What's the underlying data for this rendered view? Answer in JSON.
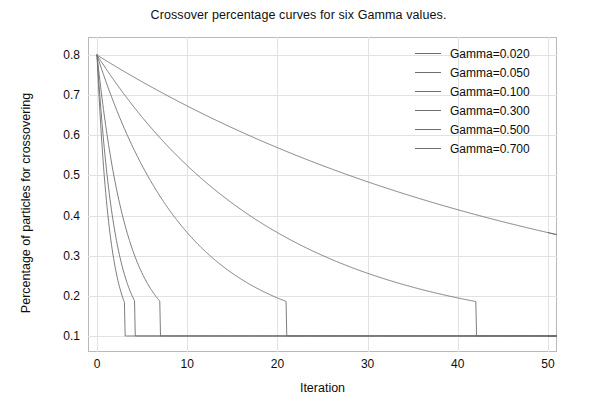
{
  "chart_data": {
    "type": "line",
    "title": "Crossover percentage curves for six Gamma values.",
    "xlabel": "Iteration",
    "ylabel": "Percentage of particles for crossovering",
    "xlim": [
      -1,
      51
    ],
    "ylim": [
      0.06,
      0.845
    ],
    "xticks": [
      0,
      10,
      20,
      30,
      40,
      50
    ],
    "xtick_labels": [
      "0",
      "10",
      "20",
      "30",
      "40",
      "50"
    ],
    "yticks": [
      0.1,
      0.2,
      0.3,
      0.4,
      0.5,
      0.6,
      0.7,
      0.8
    ],
    "ytick_labels": [
      "0.1",
      "0.2",
      "0.3",
      "0.4",
      "0.5",
      "0.6",
      "0.7",
      "0.8"
    ],
    "grid": true,
    "legend_position": "upper right",
    "start_value": 0.8,
    "floor_value": 0.1,
    "model": "y = 0.1 + 0.7 * exp(-gamma * iteration), clamped at 0.1",
    "series": [
      {
        "name": "Gamma=0.020",
        "gamma": 0.02,
        "color": "#6e6e6e",
        "x": [
          0,
          5,
          10,
          15,
          20,
          25,
          30,
          35,
          40,
          45,
          50
        ],
        "values": [
          0.8,
          0.733,
          0.673,
          0.619,
          0.569,
          0.525,
          0.484,
          0.448,
          0.415,
          0.385,
          0.357
        ],
        "reaches_floor_at": null,
        "end_value": 0.305
      },
      {
        "name": "Gamma=0.050",
        "gamma": 0.05,
        "color": "#6e6e6e",
        "x": [
          0,
          5,
          10,
          15,
          20,
          25,
          30,
          35,
          40,
          42,
          45,
          50
        ],
        "values": [
          0.8,
          0.645,
          0.525,
          0.431,
          0.357,
          0.301,
          0.256,
          0.222,
          0.195,
          0.186,
          0.1,
          0.1
        ],
        "reaches_floor_at": 42,
        "end_value": 0.1
      },
      {
        "name": "Gamma=0.100",
        "gamma": 0.1,
        "color": "#6e6e6e",
        "x": [
          0,
          2,
          4,
          6,
          8,
          10,
          13,
          16,
          19,
          21,
          30,
          40,
          50
        ],
        "values": [
          0.8,
          0.673,
          0.569,
          0.484,
          0.415,
          0.357,
          0.291,
          0.241,
          0.205,
          0.186,
          0.1,
          0.1,
          0.1
        ],
        "reaches_floor_at": 21,
        "end_value": 0.1
      },
      {
        "name": "Gamma=0.300",
        "gamma": 0.3,
        "color": "#6e6e6e",
        "x": [
          0,
          1,
          2,
          3,
          4,
          5,
          6,
          7,
          10,
          20,
          35,
          50
        ],
        "values": [
          0.8,
          0.619,
          0.484,
          0.385,
          0.311,
          0.256,
          0.216,
          0.186,
          0.1,
          0.1,
          0.1,
          0.1
        ],
        "reaches_floor_at": 7,
        "end_value": 0.1
      },
      {
        "name": "Gamma=0.500",
        "gamma": 0.5,
        "color": "#6e6e6e",
        "x": [
          0,
          0.5,
          1,
          1.5,
          2,
          2.5,
          3,
          3.5,
          4.2,
          10,
          25,
          50
        ],
        "values": [
          0.8,
          0.645,
          0.525,
          0.431,
          0.357,
          0.301,
          0.256,
          0.222,
          0.186,
          0.1,
          0.1,
          0.1
        ],
        "reaches_floor_at": 4.2,
        "end_value": 0.1
      },
      {
        "name": "Gamma=0.700",
        "gamma": 0.7,
        "color": "#6e6e6e",
        "x": [
          0,
          0.4,
          0.8,
          1.2,
          1.6,
          2,
          2.4,
          2.8,
          3.1,
          10,
          25,
          50
        ],
        "values": [
          0.8,
          0.629,
          0.5,
          0.403,
          0.329,
          0.273,
          0.231,
          0.199,
          0.186,
          0.1,
          0.1,
          0.1
        ],
        "reaches_floor_at": 3.1,
        "end_value": 0.1
      }
    ],
    "legend": [
      "Gamma=0.020",
      "Gamma=0.050",
      "Gamma=0.100",
      "Gamma=0.300",
      "Gamma=0.500",
      "Gamma=0.700"
    ]
  }
}
